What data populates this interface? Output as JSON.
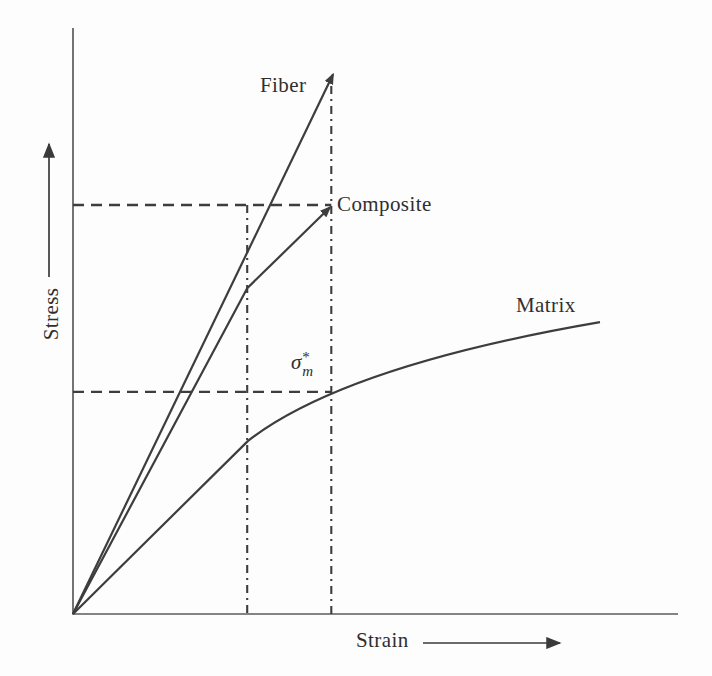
{
  "figure": {
    "background": "#fdfdfd",
    "line_color": "#3d3d3d",
    "axis_color": "#5c5c5c",
    "text_color": "#2f2f2f"
  },
  "labels": {
    "y_axis": "Stress",
    "x_axis": "Strain",
    "fiber": "Fiber",
    "composite": "Composite",
    "matrix": "Matrix",
    "sigma": {
      "base": "σ",
      "sup": "*",
      "sub": "m"
    }
  },
  "chart_data": {
    "type": "line",
    "title": "",
    "xlabel": "Strain",
    "ylabel": "Stress",
    "axes_numeric": false,
    "grid": false,
    "legend_position": "inline-labels",
    "note": "Schematic stress-strain curves for fiber, composite and matrix; axes unlabeled numerically, coordinates normalized 0-1 (strain, stress)",
    "series": [
      {
        "name": "Fiber",
        "points": [
          [
            0,
            0
          ],
          [
            0.43,
            0.921
          ]
        ],
        "arrow_end": true
      },
      {
        "name": "Composite",
        "points": [
          [
            0,
            0
          ],
          [
            0.288,
            0.556
          ],
          [
            0.425,
            0.694
          ]
        ],
        "arrow_end": true
      },
      {
        "name": "Matrix",
        "points": [
          [
            0,
            0
          ],
          [
            0.289,
            0.295
          ]
        ],
        "curve": {
          "c1": [
            0.408,
            0.391
          ],
          "c2": [
            0.623,
            0.454
          ],
          "end": [
            0.871,
            0.498
          ]
        },
        "arrow_end": false
      }
    ],
    "guides": {
      "dashed_horizontal": [
        {
          "sigma": 0.698,
          "eps_end": 0.427,
          "meaning": "composite strength level"
        },
        {
          "sigma": 0.379,
          "eps_end": 0.427,
          "meaning": "matrix stress at composite failure strain (σ*m)"
        }
      ],
      "dashdot_vertical": [
        {
          "eps": 0.288,
          "sigma_top": 0.698
        },
        {
          "eps": 0.427,
          "sigma_top": 0.901
        }
      ]
    },
    "annotations": [
      {
        "text": "σ*m",
        "eps": 0.38,
        "sigma": 0.42
      }
    ]
  }
}
